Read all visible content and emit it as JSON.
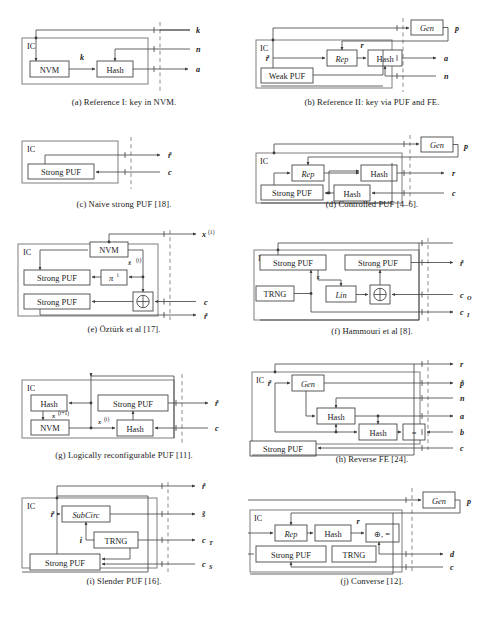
{
  "figure": {
    "kind": "multi-panel-block-diagram",
    "columns": 2,
    "rows": 5,
    "panel_count": 10,
    "colors": {
      "wire": "#3c3c3c",
      "ic_boundary": "#707070",
      "chip_boundary_dashed": "#8c8c8c",
      "background": "#ffffff",
      "text": "#1a1a1a"
    }
  },
  "panels": [
    {
      "id": "a",
      "caption": "(a) Reference I: key in NVM.",
      "ic_label": "IC",
      "blocks": [
        "NVM",
        "Hash"
      ],
      "internal_signals": [
        "k"
      ],
      "external_signals": [
        "k",
        "n",
        "a"
      ],
      "signal_directions": [
        "in",
        "in",
        "out"
      ]
    },
    {
      "id": "b",
      "caption": "(b) Reference II: key via PUF and FE.",
      "ic_label": "IC",
      "blocks": [
        "Weak PUF",
        "Rep",
        "Hash",
        "Gen"
      ],
      "internal_signals": [
        "r̃",
        "r"
      ],
      "external_signals": [
        "p",
        "a",
        "n"
      ],
      "signal_directions": [
        "out",
        "out",
        "in"
      ]
    },
    {
      "id": "c",
      "caption": "(c) Naive strong PUF [18].",
      "ic_label": "IC",
      "blocks": [
        "Strong PUF"
      ],
      "internal_signals": [],
      "external_signals": [
        "r̃",
        "c"
      ],
      "signal_directions": [
        "out",
        "in"
      ]
    },
    {
      "id": "d",
      "caption": "(d) Controlled PUF [4–6].",
      "ic_label": "IC",
      "blocks": [
        "Strong PUF",
        "Rep",
        "Hash",
        "Hash",
        "Gen"
      ],
      "internal_signals": [],
      "external_signals": [
        "p",
        "r",
        "c"
      ],
      "signal_directions": [
        "out",
        "out",
        "in"
      ]
    },
    {
      "id": "e",
      "caption": "(e) Öztürk et al [17].",
      "ic_label": "IC",
      "blocks": [
        "NVM",
        "Strong PUF",
        "πⁱ",
        "Strong PUF",
        "⊕"
      ],
      "internal_signals": [
        "x̃(t)"
      ],
      "external_signals": [
        "x(1)",
        "c",
        "r̃"
      ],
      "signal_directions": [
        "out",
        "in",
        "out"
      ]
    },
    {
      "id": "f",
      "caption": "(f) Hammouri et al [8].",
      "ic_label": "IC",
      "blocks": [
        "Strong PUF",
        "Strong PUF",
        "TRNG",
        "Lin",
        "⊕"
      ],
      "internal_signals": [
        "x"
      ],
      "external_signals": [
        "r̃",
        "c_O",
        "c_I"
      ],
      "signal_directions": [
        "out",
        "in",
        "out"
      ]
    },
    {
      "id": "g",
      "caption": "(g) Logically reconfigurable PUF [11].",
      "ic_label": "IC",
      "blocks": [
        "Hash",
        "NVM",
        "Strong PUF",
        "Hash"
      ],
      "internal_signals": [
        "x(t+1)",
        "x(t)"
      ],
      "external_signals": [
        "r̃",
        "c"
      ],
      "signal_directions": [
        "out",
        "in"
      ]
    },
    {
      "id": "h",
      "caption": "(h) Reverse FE [24].",
      "ic_label": "IC",
      "blocks": [
        "Gen",
        "Hash",
        "Hash",
        "=",
        "Strong PUF"
      ],
      "internal_signals": [
        "r̃"
      ],
      "external_signals": [
        "r",
        "p̃",
        "n",
        "a",
        "b",
        "c"
      ],
      "signal_directions": [
        "out",
        "out",
        "in",
        "out",
        "in",
        "in"
      ]
    },
    {
      "id": "i",
      "caption": "(i) Slender PUF [16].",
      "ic_label": "IC",
      "blocks": [
        "SubCirc",
        "TRNG",
        "Strong PUF"
      ],
      "internal_signals": [
        "r̃",
        "i"
      ],
      "external_signals": [
        "r̃",
        "s̃",
        "c_T",
        "c_S"
      ],
      "signal_directions": [
        "out",
        "out",
        "out",
        "in"
      ]
    },
    {
      "id": "j",
      "caption": "(j) Converse [12].",
      "ic_label": "IC",
      "blocks": [
        "Gen",
        "Rep",
        "Hash",
        "⊕, =",
        "Strong PUF",
        "TRNG"
      ],
      "internal_signals": [
        "r"
      ],
      "external_signals": [
        "p",
        "d",
        "c"
      ],
      "signal_directions": [
        "out",
        "out",
        "in"
      ]
    }
  ],
  "labels": {
    "ic": "IC",
    "nvm": "NVM",
    "hash": "Hash",
    "gen": "Gen",
    "rep": "Rep",
    "lin": "Lin",
    "trng": "TRNG",
    "subcirc": "SubCirc",
    "weak_puf": "Weak PUF",
    "strong_puf": "Strong PUF",
    "xor": "⊕",
    "xor_eq": "⊕, =",
    "eq": "=",
    "pi": "π",
    "sig_k": "k",
    "sig_n": "n",
    "sig_a": "a",
    "sig_b": "b",
    "sig_c": "c",
    "sig_d": "d",
    "sig_p": "p",
    "sig_r": "r",
    "sig_s": "s",
    "sig_i": "i",
    "sig_x": "x",
    "sig_r_tilde": "r̃",
    "sig_p_tilde": "p̃",
    "sig_s_tilde": "s̃",
    "sig_x_tilde": "x̃",
    "sub_O": "O",
    "sub_I": "I",
    "sub_T": "T",
    "sub_S": "S",
    "sup_1": "(1)",
    "sup_t": "(t)",
    "sup_t1": "(t+1)",
    "sup_i": "i"
  },
  "captions": {
    "a": "(a) Reference I: key in NVM.",
    "b": "(b) Reference II: key via PUF and FE.",
    "c": "(c) Naive strong PUF [18].",
    "d": "(d) Controlled PUF [4–6].",
    "e": "(e) Öztürk et al [17].",
    "f": "(f) Hammouri et al [8].",
    "g": "(g) Logically reconfigurable PUF [11].",
    "h": "(h) Reverse FE [24].",
    "i": "(i) Slender PUF [16].",
    "j": "(j) Converse [12]."
  }
}
